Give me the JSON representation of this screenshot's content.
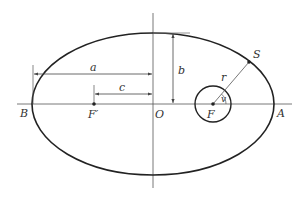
{
  "diagram": {
    "colors": {
      "ellipse": "#222222",
      "axis": "#555555",
      "dimension": "#444444",
      "text": "#333333",
      "background": "#ffffff"
    },
    "labels": {
      "a": "a",
      "b": "b",
      "c": "c",
      "r": "r",
      "S": "S",
      "B": "B",
      "F_prime": "F′",
      "O": "O",
      "F": "F",
      "A": "A",
      "nu": "v"
    },
    "geometry": {
      "center": [
        153,
        104
      ],
      "semi_major_px": 121,
      "semi_minor_px": 71,
      "focus_left": [
        94,
        104
      ],
      "focus_right": [
        213,
        104
      ],
      "focus_circle_radius": 18,
      "satellite": [
        249,
        62
      ]
    }
  }
}
